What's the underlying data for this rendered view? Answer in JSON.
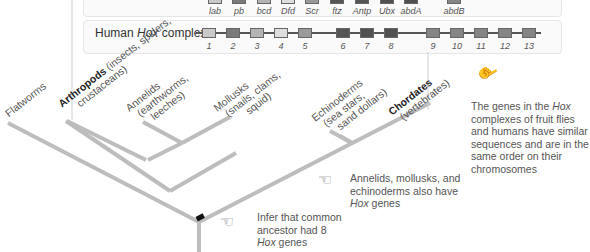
{
  "fly_complex": {
    "label": "Fruit fly Hox complex",
    "genes": [
      {
        "name": "lab",
        "x": 208,
        "color": "#c9c9c9"
      },
      {
        "name": "pb",
        "x": 232,
        "color": "#7a7a7a"
      },
      {
        "name": "bcd",
        "x": 257,
        "color": "#b4b4b4"
      },
      {
        "name": "Dfd",
        "x": 281,
        "color": "#dedede"
      },
      {
        "name": "Scr",
        "x": 305,
        "color": "#9a9a9a"
      },
      {
        "name": "ftz",
        "x": 330,
        "color": "#555555"
      },
      {
        "name": "Antp",
        "x": 355,
        "color": "#555555"
      },
      {
        "name": "Ubx",
        "x": 380,
        "color": "#505050"
      },
      {
        "name": "abdA",
        "x": 404,
        "color": "#505050"
      },
      {
        "name": "abdB",
        "x": 447,
        "color": "#858585"
      }
    ]
  },
  "human_complex": {
    "label_prefix": "Human ",
    "label_italic": "Hox",
    "label_suffix": " complex",
    "genes": [
      {
        "name": "1",
        "x": 202,
        "color": "#c9c9c9"
      },
      {
        "name": "2",
        "x": 226,
        "color": "#7a7a7a"
      },
      {
        "name": "3",
        "x": 250,
        "color": "#b4b4b4"
      },
      {
        "name": "4",
        "x": 274,
        "color": "#dedede"
      },
      {
        "name": "5",
        "x": 298,
        "color": "#9a9a9a"
      },
      {
        "name": "6",
        "x": 336,
        "color": "#555555"
      },
      {
        "name": "7",
        "x": 360,
        "color": "#505050"
      },
      {
        "name": "8",
        "x": 384,
        "color": "#505050"
      },
      {
        "name": "9",
        "x": 426,
        "color": "#858585"
      },
      {
        "name": "10",
        "x": 450,
        "color": "#858585"
      },
      {
        "name": "11",
        "x": 474,
        "color": "#858585"
      },
      {
        "name": "12",
        "x": 498,
        "color": "#858585"
      },
      {
        "name": "13",
        "x": 522,
        "color": "#858585"
      }
    ]
  },
  "taxa": [
    {
      "bold": "",
      "name": "Flatworms",
      "sub1": "",
      "sub2": ""
    },
    {
      "bold": "Arthropods",
      "name": "",
      "sub1": "(insects, spiders,",
      "sub2": "crustaceans)"
    },
    {
      "bold": "",
      "name": "Annelids",
      "sub1": "(earthworms,",
      "sub2": "leeches)"
    },
    {
      "bold": "",
      "name": "Mollusks",
      "sub1": "(snails, clams,",
      "sub2": "squid)"
    },
    {
      "bold": "",
      "name": "Echinoderms",
      "sub1": "(sea stars,",
      "sub2": "sand dollars)"
    },
    {
      "bold": "Chordates",
      "name": "",
      "sub1": "(vertebrates)",
      "sub2": ""
    }
  ],
  "notes": {
    "similar": {
      "l1a": "The genes in the ",
      "l1b": "Hox",
      "l2": "complexes of fruit flies",
      "l3": "and humans have similar",
      "l4": "sequences and are in the",
      "l5": "same order on their",
      "l6": "chromosomes"
    },
    "also": {
      "l1": "Annelids, mollusks, and",
      "l2": "echinoderms also have",
      "l3a": "Hox",
      "l3b": " genes"
    },
    "infer": {
      "l1": "Infer that common",
      "l2": "ancestor had 8",
      "l3a": "Hox",
      "l3b": " genes"
    }
  },
  "colors": {
    "branch": "#bdbdbd",
    "marker": "#111111"
  }
}
